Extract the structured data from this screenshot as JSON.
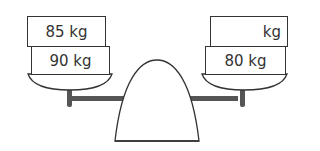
{
  "scale": {
    "left_pan": {
      "weights": [
        {
          "label": "85 kg"
        },
        {
          "label": "90 kg"
        }
      ]
    },
    "right_pan": {
      "weights": [
        {
          "label": "kg"
        },
        {
          "label": "80 kg"
        }
      ]
    }
  },
  "colors": {
    "outline": "#333333",
    "beam": "#555555",
    "background": "#ffffff"
  }
}
